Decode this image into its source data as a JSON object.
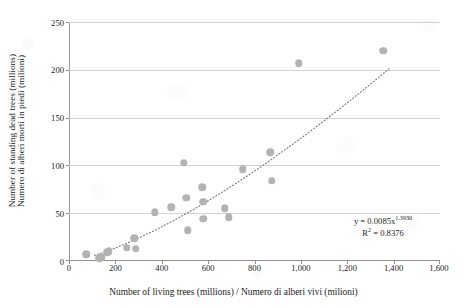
{
  "chart_data": {
    "type": "scatter",
    "title": "",
    "xlabel": "Number of living trees (millions) / Numero di alberi vivi (milioni)",
    "ylabel_lines": [
      "Number of standing dead trees (millions)",
      "Numero di alberi morti in piedi (milioni)"
    ],
    "xlim": [
      0,
      1600
    ],
    "ylim": [
      0,
      250
    ],
    "x_ticks": [
      0,
      200,
      400,
      600,
      800,
      1000,
      1200,
      1400,
      1600
    ],
    "x_tick_labels": [
      "0",
      "200",
      "400",
      "600",
      "800",
      "1,000",
      "1,200",
      "1,400",
      "1,600"
    ],
    "y_ticks": [
      0,
      50,
      100,
      150,
      200,
      250
    ],
    "y_tick_labels": [
      "0",
      "50",
      "100",
      "150",
      "200",
      "250"
    ],
    "grid": "horizontal",
    "legend": "none",
    "marker_color": "#b3b3b3",
    "marker_shape": "circle",
    "trendline": {
      "style": "dotted",
      "color": "#7a7a7a",
      "type": "power",
      "equation": "y = 0.0085x",
      "exponent": "1.3930",
      "r_squared_label": "R",
      "r_squared_exponent": "2",
      "r_squared_value": "= 0.8376",
      "equation_full": "y = 0.0085x^1.3930",
      "r2_full": "R2 = 0.8376"
    },
    "points": [
      {
        "x": 75,
        "y": 7
      },
      {
        "x": 130,
        "y": 3
      },
      {
        "x": 140,
        "y": 4
      },
      {
        "x": 165,
        "y": 9
      },
      {
        "x": 172,
        "y": 10
      },
      {
        "x": 250,
        "y": 14
      },
      {
        "x": 282,
        "y": 24
      },
      {
        "x": 287,
        "y": 13
      },
      {
        "x": 370,
        "y": 51
      },
      {
        "x": 442,
        "y": 56
      },
      {
        "x": 495,
        "y": 103
      },
      {
        "x": 505,
        "y": 66
      },
      {
        "x": 512,
        "y": 32
      },
      {
        "x": 575,
        "y": 77
      },
      {
        "x": 578,
        "y": 62
      },
      {
        "x": 580,
        "y": 44
      },
      {
        "x": 672,
        "y": 55
      },
      {
        "x": 688,
        "y": 46
      },
      {
        "x": 750,
        "y": 96
      },
      {
        "x": 868,
        "y": 114
      },
      {
        "x": 875,
        "y": 84
      },
      {
        "x": 990,
        "y": 207
      },
      {
        "x": 1355,
        "y": 220
      }
    ]
  }
}
